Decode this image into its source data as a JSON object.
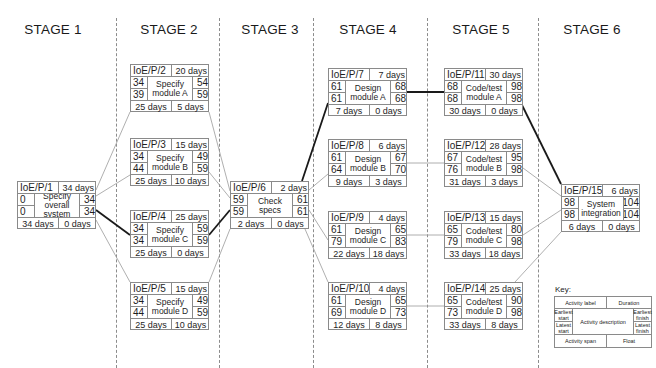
{
  "stages": [
    {
      "label": "STAGE 1"
    },
    {
      "label": "STAGE 2"
    },
    {
      "label": "STAGE 3"
    },
    {
      "label": "STAGE 4"
    },
    {
      "label": "STAGE 5"
    },
    {
      "label": "STAGE 6"
    }
  ],
  "nodes": [
    {
      "id": "IoE/P/1",
      "duration": "34 days",
      "es": "0",
      "ls": "0",
      "ef": "34",
      "lf": "34",
      "description": "Specify overall system",
      "span": "34 days",
      "float": "0 days",
      "stage": 1,
      "critical": true
    },
    {
      "id": "IoE/P/2",
      "duration": "20 days",
      "es": "34",
      "ls": "39",
      "ef": "54",
      "lf": "59",
      "description": "Specify module A",
      "span": "25 days",
      "float": "5 days",
      "stage": 2,
      "critical": false
    },
    {
      "id": "IoE/P/3",
      "duration": "15 days",
      "es": "34",
      "ls": "44",
      "ef": "49",
      "lf": "59",
      "description": "Specify module B",
      "span": "25 days",
      "float": "10 days",
      "stage": 2,
      "critical": false
    },
    {
      "id": "IoE/P/4",
      "duration": "25 days",
      "es": "34",
      "ls": "34",
      "ef": "59",
      "lf": "59",
      "description": "Specify module C",
      "span": "25 days",
      "float": "0 days",
      "stage": 2,
      "critical": true
    },
    {
      "id": "IoE/P/5",
      "duration": "15 days",
      "es": "34",
      "ls": "44",
      "ef": "49",
      "lf": "59",
      "description": "Specify module D",
      "span": "25 days",
      "float": "10 days",
      "stage": 2,
      "critical": false
    },
    {
      "id": "IoE/P/6",
      "duration": "2 days",
      "es": "59",
      "ls": "59",
      "ef": "61",
      "lf": "61",
      "description": "Check specs",
      "span": "2 days",
      "float": "0 days",
      "stage": 3,
      "critical": true
    },
    {
      "id": "IoE/P/7",
      "duration": "7 days",
      "es": "61",
      "ls": "61",
      "ef": "68",
      "lf": "68",
      "description": "Design module A",
      "span": "7 days",
      "float": "0 days",
      "stage": 4,
      "critical": true
    },
    {
      "id": "IoE/P/8",
      "duration": "6 days",
      "es": "61",
      "ls": "64",
      "ef": "67",
      "lf": "70",
      "description": "Design module B",
      "span": "9 days",
      "float": "3 days",
      "stage": 4,
      "critical": false
    },
    {
      "id": "IoE/P/9",
      "duration": "4 days",
      "es": "61",
      "ls": "79",
      "ef": "65",
      "lf": "83",
      "description": "Design module C",
      "span": "22 days",
      "float": "18 days",
      "stage": 4,
      "critical": false
    },
    {
      "id": "IoE/P/10",
      "duration": "4 days",
      "es": "61",
      "ls": "69",
      "ef": "65",
      "lf": "73",
      "description": "Design module D",
      "span": "12 days",
      "float": "8 days",
      "stage": 4,
      "critical": false
    },
    {
      "id": "IoE/P/11",
      "duration": "30 days",
      "es": "68",
      "ls": "68",
      "ef": "98",
      "lf": "98",
      "description": "Code/test module A",
      "span": "30 days",
      "float": "0 days",
      "stage": 5,
      "critical": true
    },
    {
      "id": "IoE/P/12",
      "duration": "28 days",
      "es": "67",
      "ls": "76",
      "ef": "95",
      "lf": "98",
      "description": "Code/test module B",
      "span": "31 days",
      "float": "3 days",
      "stage": 5,
      "critical": false
    },
    {
      "id": "IoE/P/13",
      "duration": "15 days",
      "es": "65",
      "ls": "79",
      "ef": "80",
      "lf": "98",
      "description": "Code/test module C",
      "span": "33 days",
      "float": "18 days",
      "stage": 5,
      "critical": false
    },
    {
      "id": "IoE/P/14",
      "duration": "25 days",
      "es": "65",
      "ls": "73",
      "ef": "90",
      "lf": "98",
      "description": "Code/test module D",
      "span": "33 days",
      "float": "8 days",
      "stage": 5,
      "critical": false
    },
    {
      "id": "IoE/P/15",
      "duration": "6 days",
      "es": "98",
      "ls": "98",
      "ef": "104",
      "lf": "104",
      "description": "System integration",
      "span": "6 days",
      "float": "0 days",
      "stage": 6,
      "critical": true
    }
  ],
  "edges": [
    {
      "from": "IoE/P/1",
      "to": "IoE/P/2",
      "critical": false
    },
    {
      "from": "IoE/P/1",
      "to": "IoE/P/3",
      "critical": false
    },
    {
      "from": "IoE/P/1",
      "to": "IoE/P/4",
      "critical": true
    },
    {
      "from": "IoE/P/1",
      "to": "IoE/P/5",
      "critical": false
    },
    {
      "from": "IoE/P/2",
      "to": "IoE/P/6",
      "critical": false
    },
    {
      "from": "IoE/P/3",
      "to": "IoE/P/6",
      "critical": false
    },
    {
      "from": "IoE/P/4",
      "to": "IoE/P/6",
      "critical": true
    },
    {
      "from": "IoE/P/5",
      "to": "IoE/P/6",
      "critical": false
    },
    {
      "from": "IoE/P/6",
      "to": "IoE/P/7",
      "critical": true
    },
    {
      "from": "IoE/P/6",
      "to": "IoE/P/8",
      "critical": false
    },
    {
      "from": "IoE/P/6",
      "to": "IoE/P/9",
      "critical": false
    },
    {
      "from": "IoE/P/6",
      "to": "IoE/P/10",
      "critical": false
    },
    {
      "from": "IoE/P/7",
      "to": "IoE/P/11",
      "critical": true
    },
    {
      "from": "IoE/P/8",
      "to": "IoE/P/12",
      "critical": false
    },
    {
      "from": "IoE/P/9",
      "to": "IoE/P/13",
      "critical": false
    },
    {
      "from": "IoE/P/10",
      "to": "IoE/P/14",
      "critical": false
    },
    {
      "from": "IoE/P/11",
      "to": "IoE/P/15",
      "critical": true
    },
    {
      "from": "IoE/P/12",
      "to": "IoE/P/15",
      "critical": false
    },
    {
      "from": "IoE/P/13",
      "to": "IoE/P/15",
      "critical": false
    },
    {
      "from": "IoE/P/14",
      "to": "IoE/P/15",
      "critical": false
    }
  ],
  "key": {
    "title": "Key:",
    "activity_label": "Activity label",
    "duration": "Duration",
    "earliest_start": "Earliest start",
    "latest_start": "Latest start",
    "activity_description": "Activity description",
    "earliest_finish": "Earliest finish",
    "latest_finish": "Latest finish",
    "activity_span": "Activity span",
    "float": "Float"
  },
  "colors": {
    "critical_line": "#1a1a1a",
    "normal_line": "#9a9a9a",
    "box_border": "#8a8a8a",
    "divider": "#8c8c8c"
  }
}
